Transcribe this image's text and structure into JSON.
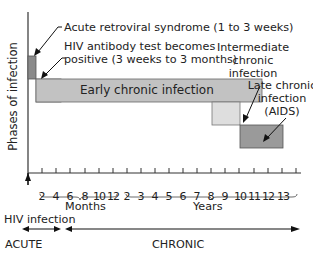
{
  "diagram": {
    "y_axis_label": "Phases of infection",
    "annotations": {
      "acute_retroviral": "Acute retroviral syndrome (1 to 3 weeks)",
      "antibody_line1": "HIV antibody test becomes",
      "antibody_line2": "positive (3 weeks to 3 months)",
      "intermediate_line1": "Intermediate",
      "intermediate_line2": "chronic",
      "intermediate_line3": "infection",
      "late_line1": "Late chronic",
      "late_line2": "infection",
      "late_line3": "(AIDS)"
    },
    "phases": [
      {
        "name": "Acute retroviral syndrome",
        "color": "#8a8a8a"
      },
      {
        "name": "Early chronic infection",
        "label": "Early chronic infection",
        "color": "#c2c2c2"
      },
      {
        "name": "Intermediate chronic infection",
        "color": "#dedede"
      },
      {
        "name": "Late chronic infection (AIDS)",
        "color": "#9a9a9a"
      }
    ],
    "x_axis": {
      "month_ticks": [
        "2",
        "4",
        "6",
        "8",
        "10",
        "12"
      ],
      "month_label": "Months",
      "year_ticks": [
        "2",
        "3",
        "4",
        "5",
        "6",
        "7",
        "8",
        "9",
        "10",
        "11",
        "12",
        "13"
      ],
      "year_label": "Years",
      "origin_label": "HIV infection"
    },
    "stages": {
      "acute": "ACUTE",
      "chronic": "CHRONIC"
    }
  }
}
